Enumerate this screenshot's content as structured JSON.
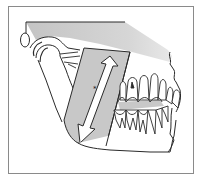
{
  "figure": {
    "type": "anatomical illustration",
    "annotations": [
      {
        "symbol": "*",
        "description": "asterisk marker on double-headed arrow along ramus"
      }
    ],
    "elements": {
      "frame": "thin grey rectangular border",
      "skull_base": "shaded grey band across top",
      "ear": "oval outline at left",
      "condyle": "mandibular condyle in glenoid fossa",
      "ramus_band": "shaded grey parallelogram along mandibular ramus",
      "arrow": "white double-headed arrow spanning ramus height",
      "occlusal_band": "shaded grey band between upper and lower teeth",
      "teeth": "upper and lower molars, premolars, canine and incisors"
    },
    "colors": {
      "outline": "#2a2a2a",
      "shade": "#c8c8c8",
      "shade_light": "#dcdcdc",
      "background": "#ffffff",
      "frame": "#8a8a8a"
    }
  },
  "labels": {
    "asterisk": "*"
  }
}
